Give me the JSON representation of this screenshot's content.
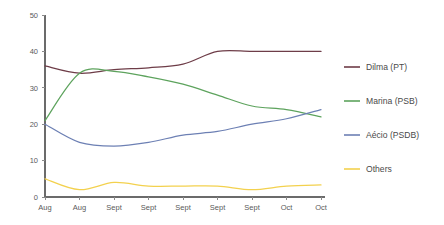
{
  "chart_data": {
    "type": "line",
    "title": "",
    "subtitle": "",
    "xlabel": "",
    "ylabel": "",
    "categories": [
      "Aug",
      "Aug",
      "Sept",
      "Sept",
      "Sept",
      "Sept",
      "Sept",
      "Oct",
      "Oct"
    ],
    "ylim": [
      0,
      50
    ],
    "yticks": [
      0,
      10,
      20,
      30,
      40,
      50
    ],
    "ytick_labels": [
      "0",
      "10",
      "20",
      "30",
      "40",
      "50"
    ],
    "grid": false,
    "legend_position": "right",
    "smoothing": "spline",
    "series": [
      {
        "name": "Dilma (PT)",
        "color": "#6e3d48",
        "values": [
          36,
          34,
          35,
          35.5,
          36.5,
          40,
          40,
          40,
          40
        ]
      },
      {
        "name": "Marina (PSB)",
        "color": "#5da35d",
        "values": [
          21,
          34,
          34.5,
          33,
          31,
          28,
          25,
          24,
          22
        ]
      },
      {
        "name": "Aécio (PSDB)",
        "color": "#6d80b4",
        "values": [
          20,
          15,
          14,
          15,
          17,
          18,
          20,
          21.5,
          24
        ]
      },
      {
        "name": "Others",
        "color": "#f3d14e",
        "values": [
          5,
          2,
          4,
          3,
          3,
          3,
          2,
          3,
          3.3
        ]
      }
    ]
  },
  "legend": {
    "entries": [
      {
        "label": "Dilma (PT)",
        "color": "#6e3d48"
      },
      {
        "label": "Marina (PSB)",
        "color": "#5da35d"
      },
      {
        "label": "Aécio (PSDB)",
        "color": "#6d80b4"
      },
      {
        "label": "Others",
        "color": "#f3d14e"
      }
    ]
  },
  "colors": {
    "background": "#ffffff",
    "axis": "#6b6b6b",
    "tick_text": "#5a5a5a",
    "legend_text": "#4a4a4a"
  }
}
